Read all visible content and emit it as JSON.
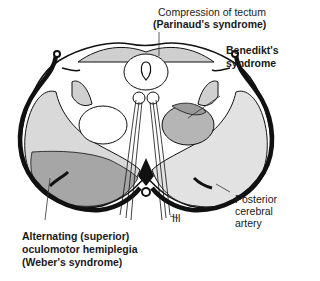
{
  "diagram": {
    "labels": {
      "tectum_line1": "Compression of tectum",
      "tectum_line2": "(Parinaud's syndrome)",
      "benedikt_line1": "Benedikt's",
      "benedikt_line2": "syndrome",
      "artery_line1": "Posterior",
      "artery_line2": "cerebral",
      "artery_line3": "artery",
      "nerve": "III",
      "weber_line1": "Alternating (superior)",
      "weber_line2": "oculomotor hemiplegia",
      "weber_line3": "(Weber's syndrome)"
    },
    "colors": {
      "outline": "#111111",
      "light_gray": "#d9d9d9",
      "mid_gray": "#bdbdbd",
      "dark_gray": "#a3a3a3",
      "background": "#ffffff"
    }
  }
}
